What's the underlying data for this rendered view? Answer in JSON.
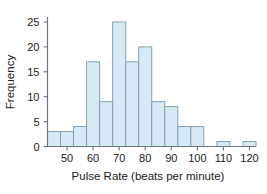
{
  "chart_data": {
    "type": "bar",
    "title": "",
    "subtitle": "",
    "xlabel": "Pulse Rate (beats per minute)",
    "ylabel": "Frequency",
    "xlim": [
      42.5,
      122.5
    ],
    "ylim": [
      0,
      26
    ],
    "grid": false,
    "legend": null,
    "bin_width": 5,
    "bin_starts": [
      42.5,
      47.5,
      52.5,
      57.5,
      62.5,
      67.5,
      72.5,
      77.5,
      82.5,
      87.5,
      92.5,
      97.5,
      102.5,
      107.5,
      112.5,
      117.5
    ],
    "bin_labels": [
      "42.5-47.5",
      "47.5-52.5",
      "52.5-57.5",
      "57.5-62.5",
      "62.5-67.5",
      "67.5-72.5",
      "72.5-77.5",
      "77.5-82.5",
      "82.5-87.5",
      "87.5-92.5",
      "92.5-97.5",
      "97.5-102.5",
      "102.5-107.5",
      "107.5-112.5",
      "112.5-117.5",
      "117.5-122.5"
    ],
    "values": [
      3,
      3,
      4,
      17,
      9,
      25,
      17,
      20,
      9,
      8,
      4,
      4,
      0,
      1,
      0,
      1
    ],
    "categories": [
      "42.5",
      "47.5",
      "52.5",
      "57.5",
      "62.5",
      "67.5",
      "72.5",
      "77.5",
      "82.5",
      "87.5",
      "92.5",
      "97.5",
      "102.5",
      "107.5",
      "112.5",
      "117.5"
    ],
    "x_ticks": [
      50,
      60,
      70,
      80,
      90,
      100,
      110,
      120
    ],
    "x_tick_labels": [
      "50",
      "60",
      "70",
      "80",
      "90",
      "100",
      "110",
      "120"
    ],
    "y_ticks": [
      0,
      5,
      10,
      15,
      20,
      25
    ],
    "y_tick_labels": [
      "0",
      "5",
      "10",
      "15",
      "20",
      "25"
    ],
    "bar_fill_color": "#d6e9f4",
    "bar_edge_color": "#7d98ab",
    "axis_color": "#6b7780",
    "text_color": "#1a1a1a",
    "background_color": "#ffffff"
  }
}
